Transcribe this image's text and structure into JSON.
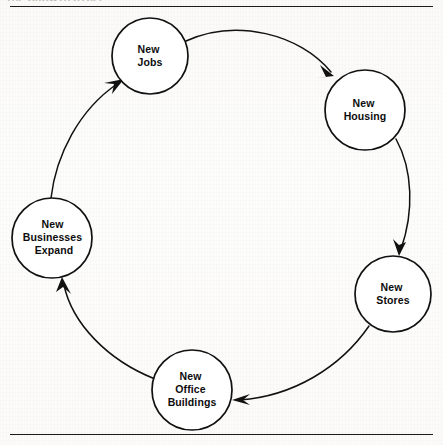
{
  "page": {
    "background_color": "#fdfcfa",
    "ink_color": "#111111",
    "clipped_header_text": "THE GROWTH CYCLE"
  },
  "diagram": {
    "type": "cycle-diagram",
    "direction": "clockwise",
    "nodes": [
      {
        "id": "new-jobs",
        "lines": [
          "New",
          "Jobs"
        ],
        "cx": 150,
        "cy": 56,
        "r": 38
      },
      {
        "id": "new-housing",
        "lines": [
          "New",
          "Housing"
        ],
        "cx": 365,
        "cy": 110,
        "r": 40
      },
      {
        "id": "new-stores",
        "lines": [
          "New",
          "Stores"
        ],
        "cx": 393,
        "cy": 294,
        "r": 38
      },
      {
        "id": "new-office-buildings",
        "lines": [
          "New",
          "Office",
          "Buildings"
        ],
        "cx": 192,
        "cy": 390,
        "r": 40
      },
      {
        "id": "new-businesses-expand",
        "lines": [
          "New",
          "Businesses",
          "Expand"
        ],
        "cx": 52,
        "cy": 238,
        "r": 40
      }
    ],
    "edges": [
      {
        "id": "jobs-to-housing",
        "from": "new-jobs",
        "to": "new-housing",
        "arrowhead": true
      },
      {
        "id": "housing-to-stores",
        "from": "new-housing",
        "to": "new-stores",
        "arrowhead": true
      },
      {
        "id": "stores-to-offices",
        "from": "new-stores",
        "to": "new-office-buildings",
        "arrowhead": true
      },
      {
        "id": "offices-to-business",
        "from": "new-office-buildings",
        "to": "new-businesses-expand",
        "arrowhead": true
      },
      {
        "id": "business-to-jobs",
        "from": "new-businesses-expand",
        "to": "new-jobs",
        "arrowhead": true
      }
    ]
  },
  "rules": {
    "top_label": "top-horizontal-rule",
    "bottom_label": "bottom-horizontal-rule"
  }
}
